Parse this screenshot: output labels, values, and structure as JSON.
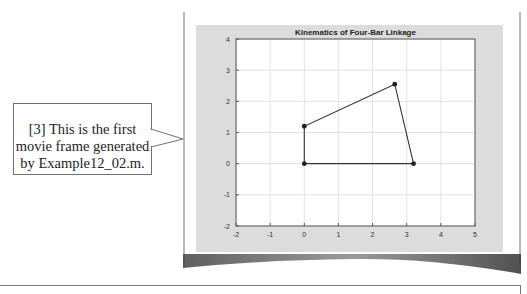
{
  "callout": {
    "lines": [
      "[3] This is the first",
      "movie frame generated",
      "by Example12_02.m."
    ]
  },
  "figure": {
    "background": "#dcdcdc",
    "plot_background": "#ffffff"
  },
  "chart_data": {
    "type": "line",
    "title": "Kinematics of Four-Bar Linkage",
    "xlabel": "",
    "ylabel": "",
    "xlim": [
      -2,
      5
    ],
    "ylim": [
      -2,
      4
    ],
    "xticks": [
      -2,
      -1,
      0,
      1,
      2,
      3,
      4,
      5
    ],
    "yticks": [
      -2,
      -1,
      0,
      1,
      2,
      3,
      4
    ],
    "grid": true,
    "legend": null,
    "series": [
      {
        "name": "four-bar linkage",
        "x": [
          0,
          0,
          2.65,
          3.2,
          0
        ],
        "y": [
          0,
          1.2,
          2.55,
          0,
          0
        ],
        "marker": "circle",
        "color": "#333333"
      }
    ],
    "joints": [
      {
        "x": 0,
        "y": 0
      },
      {
        "x": 0,
        "y": 1.2
      },
      {
        "x": 2.65,
        "y": 2.55
      },
      {
        "x": 3.2,
        "y": 0
      }
    ]
  }
}
